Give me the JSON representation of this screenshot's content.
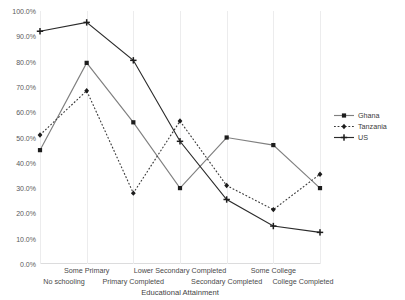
{
  "chart_data": {
    "type": "line",
    "title": "",
    "xlabel": "Educational Attainment",
    "ylabel": "",
    "categories": [
      "No schooling",
      "Some Primary",
      "Primary Completed",
      "Lower Secondary Completed",
      "Secondary Completed",
      "Some College",
      "College Completed"
    ],
    "ylim": [
      0,
      100
    ],
    "ytick_values": [
      0,
      10,
      20,
      30,
      40,
      50,
      60,
      70,
      80,
      90,
      100
    ],
    "ytick_labels": [
      "0.0%",
      "10.0%",
      "20.0%",
      "30.0%",
      "40.0%",
      "50.0%",
      "60.0%",
      "70.0%",
      "80.0%",
      "90.0%",
      "100.0%"
    ],
    "grid": "vertical",
    "legend_position": "right",
    "series": [
      {
        "name": "Ghana",
        "values": [
          45.0,
          79.5,
          56.0,
          30.0,
          50.0,
          47.0,
          30.0
        ],
        "color": "#808080",
        "linestyle": "solid",
        "marker": "square"
      },
      {
        "name": "Tanzania",
        "values": [
          51.0,
          68.5,
          28.0,
          56.5,
          31.0,
          21.5,
          35.5
        ],
        "color": "#3a3a3a",
        "linestyle": "dotted",
        "marker": "diamond"
      },
      {
        "name": "US",
        "values": [
          92.0,
          95.5,
          80.5,
          48.5,
          25.5,
          15.0,
          12.5
        ],
        "color": "#2b2b2b",
        "linestyle": "solid",
        "marker": "cross"
      }
    ]
  },
  "legend": {
    "entries": [
      {
        "label": "Ghana"
      },
      {
        "label": "Tanzania"
      },
      {
        "label": "US"
      }
    ]
  }
}
